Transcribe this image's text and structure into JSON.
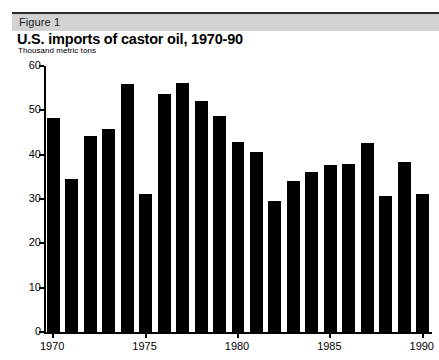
{
  "figure": {
    "label": "Figure 1",
    "title": "U.S. imports of castor oil, 1970-90",
    "subtitle": "Thousand metric tons"
  },
  "colors": {
    "bar": "#000000",
    "band": "#d2d2d2",
    "rule": "#2b2b2b",
    "axis": "#000000",
    "background": "#ffffff"
  },
  "chart_data": {
    "type": "bar",
    "title": "U.S. imports of castor oil, 1970-90",
    "subtitle": "Thousand metric tons",
    "xlabel": "",
    "ylabel": "Thousand metric tons",
    "ylim": [
      0,
      60
    ],
    "yticks": [
      0,
      10,
      20,
      30,
      40,
      50,
      60
    ],
    "xticks": [
      1970,
      1975,
      1980,
      1985,
      1990
    ],
    "grid": false,
    "legend": false,
    "categories": [
      1970,
      1971,
      1972,
      1973,
      1974,
      1975,
      1976,
      1977,
      1978,
      1979,
      1980,
      1981,
      1982,
      1983,
      1984,
      1985,
      1986,
      1987,
      1988,
      1989,
      1990
    ],
    "values": [
      48.3,
      34.6,
      44.2,
      45.8,
      56.0,
      31.2,
      53.7,
      56.2,
      52.1,
      48.8,
      42.8,
      40.6,
      29.5,
      34.0,
      36.0,
      37.6,
      37.8,
      42.6,
      30.6,
      38.3,
      31.2
    ],
    "series": [
      {
        "name": "U.S. imports of castor oil",
        "units": "Thousand metric tons",
        "values": [
          48.3,
          34.6,
          44.2,
          45.8,
          56.0,
          31.2,
          53.7,
          56.2,
          52.1,
          48.8,
          42.8,
          40.6,
          29.5,
          34.0,
          36.0,
          37.6,
          37.8,
          42.6,
          30.6,
          38.3,
          31.2
        ]
      }
    ]
  }
}
